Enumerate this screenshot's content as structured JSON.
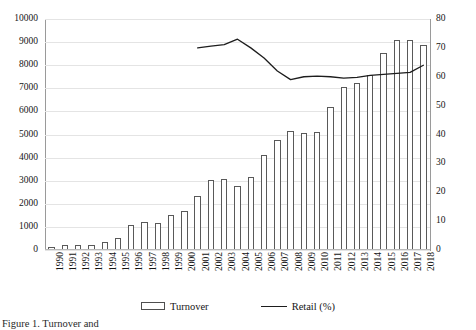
{
  "caption": {
    "text": "Figure 1. Turnover and"
  },
  "legend": {
    "position": "bottom-center",
    "items": [
      {
        "name": "turnover",
        "label": "Turnover",
        "marker": "bar-swatch"
      },
      {
        "name": "retail",
        "label": "Retail (%)",
        "marker": "line-swatch"
      }
    ]
  },
  "axes": {
    "left": {
      "ticks": [
        "0",
        "1000",
        "2000",
        "3000",
        "4000",
        "5000",
        "6000",
        "7000",
        "8000",
        "9000",
        "10000"
      ],
      "min": 0,
      "max": 10000,
      "step": 1000
    },
    "right": {
      "ticks": [
        "0",
        "10",
        "20",
        "30",
        "40",
        "50",
        "60",
        "70",
        "80"
      ],
      "min": 0,
      "max": 80,
      "step": 10
    }
  },
  "chart_data": {
    "type": "bar",
    "title": "",
    "subtitle": "",
    "xlabel": "",
    "ylabel": "",
    "y2label": "",
    "grid": true,
    "legend_position": "bottom-center",
    "ylim": [
      0,
      10000
    ],
    "y2lim": [
      0,
      80
    ],
    "categories": [
      "1990",
      "1991",
      "1992",
      "1993",
      "1994",
      "1995",
      "1996",
      "1997",
      "1998",
      "1999",
      "2000",
      "2001",
      "2002",
      "2003",
      "2004",
      "2005",
      "2006",
      "2007",
      "2008",
      "2009",
      "2010",
      "2011",
      "2012",
      "2013",
      "2014",
      "2015",
      "2016",
      "2017",
      "2018"
    ],
    "series": [
      {
        "name": "Turnover",
        "type": "bar",
        "axis": "left",
        "color": "#ffffff",
        "edge_color": "#595959",
        "values": [
          150,
          200,
          230,
          200,
          330,
          520,
          1080,
          1230,
          1180,
          1520,
          1680,
          2340,
          3020,
          3060,
          2790,
          3160,
          4110,
          4760,
          5140,
          5050,
          5090,
          6210,
          7050,
          7220,
          7590,
          8540,
          9110,
          9110,
          8890
        ]
      },
      {
        "name": "Retail (%)",
        "type": "line",
        "axis": "right",
        "color": "#1d1d1d",
        "values": [
          null,
          null,
          null,
          null,
          null,
          null,
          null,
          null,
          null,
          null,
          null,
          70.0,
          70.6,
          71.1,
          73.0,
          70.0,
          66.5,
          62.0,
          59.0,
          60.0,
          60.2,
          60.0,
          59.5,
          59.8,
          60.5,
          60.8,
          61.2,
          61.5,
          64.0
        ]
      }
    ]
  }
}
